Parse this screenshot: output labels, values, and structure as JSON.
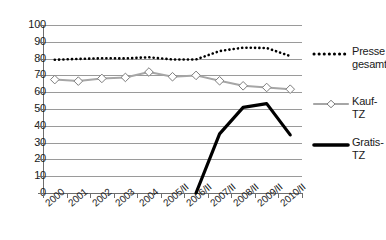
{
  "chart_data": {
    "type": "line",
    "title": "",
    "subtitle": "",
    "xlabel": "",
    "ylabel": "",
    "ylim": [
      0,
      100
    ],
    "yticks": [
      0,
      10,
      20,
      30,
      40,
      50,
      60,
      70,
      80,
      90,
      100
    ],
    "grid": true,
    "legend_position": "right",
    "categories": [
      "2000",
      "2001",
      "2002",
      "2003",
      "2004",
      "2005/II",
      "2006/II",
      "2007/II",
      "2008/II",
      "2009/II",
      "2010/II"
    ],
    "series": [
      {
        "name": "Presse gesamt",
        "style": "dotted",
        "color": "#000000",
        "marker": "none",
        "values": [
          79.3,
          79.8,
          80.2,
          80.1,
          80.8,
          79.5,
          79.5,
          84.5,
          86.5,
          86.3,
          81.5
        ]
      },
      {
        "name": "Kauf-TZ",
        "style": "solid",
        "color": "#a6a6a6",
        "marker": "diamond",
        "values": [
          67.5,
          66.6,
          68.2,
          68.8,
          72.0,
          69.2,
          70.0,
          66.8,
          63.8,
          62.8,
          61.8
        ]
      },
      {
        "name": "Gratis-TZ",
        "style": "solid-thick",
        "color": "#000000",
        "marker": "none",
        "values": [
          null,
          null,
          null,
          null,
          null,
          null,
          0,
          35.2,
          51.0,
          53.2,
          34.6
        ]
      }
    ]
  },
  "legend": {
    "items": [
      {
        "label_line1": "Presse",
        "label_line2": "gesamt",
        "sample": "dotted-line-sample"
      },
      {
        "label_line1": "Kauf-",
        "label_line2": "TZ",
        "sample": "gray-diamond-line-sample"
      },
      {
        "label_line1": "Gratis-",
        "label_line2": "TZ",
        "sample": "black-thick-line-sample"
      }
    ]
  },
  "axis": {
    "y_tick_labels": [
      "100",
      "90",
      "80",
      "70",
      "60",
      "50",
      "40",
      "30",
      "20",
      "10",
      "0"
    ],
    "x_tick_labels": [
      "2000",
      "2001",
      "2002",
      "2003",
      "2004",
      "2005/II",
      "2006/II",
      "2007/II",
      "2008/II",
      "2009/II",
      "2010/II"
    ]
  }
}
